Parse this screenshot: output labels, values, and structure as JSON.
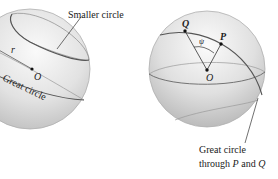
{
  "figure": {
    "left_sphere": {
      "labels": {
        "smaller_circle": "Smaller circle",
        "radius": "r",
        "center": "O",
        "great_circle": "Great circle"
      }
    },
    "right_sphere": {
      "labels": {
        "point_q": "Q",
        "point_p": "P",
        "angle": "ψ",
        "center": "O",
        "caption_line1": "Great circle",
        "caption_line2_prefix": "through ",
        "caption_line2_p": "P",
        "caption_line2_and": " and ",
        "caption_line2_q": "Q"
      }
    },
    "colors": {
      "sphere_light": "#f4f4f4",
      "sphere_mid": "#d9d9d9",
      "sphere_dark": "#a9a9a9",
      "circle_stroke": "#666666",
      "text": "#222222"
    }
  }
}
